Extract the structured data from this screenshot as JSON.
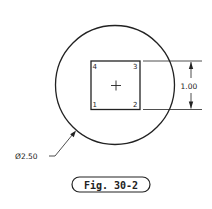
{
  "figure": {
    "caption": "Fig. 30-2"
  },
  "drawing": {
    "circle": {
      "diameter_label": "Ø2.50"
    },
    "square": {
      "corners": [
        "1",
        "2",
        "3",
        "4"
      ],
      "center_mark": "+"
    },
    "dimension": {
      "height_label": "1.00"
    }
  },
  "colors": {
    "line": "#222222",
    "background": "#ffffff"
  }
}
